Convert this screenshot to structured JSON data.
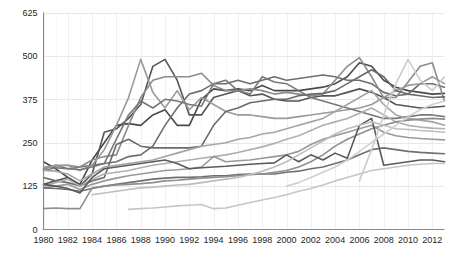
{
  "chart_data": {
    "type": "line",
    "title": "",
    "subtitle": "",
    "xlabel": "",
    "ylabel": "",
    "xlim": [
      1980,
      2013
    ],
    "ylim": [
      0,
      625
    ],
    "ytick_values": [
      0,
      125,
      250,
      375,
      500,
      625
    ],
    "ytick_labels": [
      "0",
      "125",
      "250",
      "375",
      "500",
      "625"
    ],
    "xtick_values": [
      1980,
      1982,
      1984,
      1986,
      1988,
      1990,
      1992,
      1994,
      1996,
      1998,
      2000,
      2002,
      2004,
      2006,
      2008,
      2010,
      2012
    ],
    "xtick_labels": [
      "1980",
      "1982",
      "1984",
      "1986",
      "1988",
      "1990",
      "1992",
      "1994",
      "1996",
      "1998",
      "2000",
      "2002",
      "2004",
      "2006",
      "2008",
      "2010",
      "2012"
    ],
    "grid": {
      "horizontal": true,
      "vertical": true,
      "horizontal_color": "#e8e8e8",
      "vertical_color": "#f0f0f0"
    },
    "legend": {
      "visible": false,
      "position": "none"
    },
    "axis_color": "#8a8a8a",
    "background_color": "#ffffff",
    "x": [
      1980,
      1981,
      1982,
      1983,
      1984,
      1985,
      1986,
      1987,
      1988,
      1989,
      1990,
      1991,
      1992,
      1993,
      1994,
      1995,
      1996,
      1997,
      1998,
      1999,
      2000,
      2001,
      2002,
      2003,
      2004,
      2005,
      2006,
      2007,
      2008,
      2009,
      2010,
      2011,
      2012,
      2013
    ],
    "series": [
      {
        "name": "series-1",
        "color": "#4a4a4a",
        "width": 1.6,
        "values": [
          195,
          175,
          150,
          130,
          200,
          250,
          300,
          305,
          300,
          330,
          345,
          300,
          300,
          375,
          405,
          400,
          405,
          400,
          415,
          400,
          400,
          400,
          405,
          410,
          420,
          440,
          480,
          470,
          430,
          410,
          400,
          395,
          390,
          392
        ]
      },
      {
        "name": "series-2",
        "color": "#555555",
        "width": 1.6,
        "values": [
          130,
          140,
          150,
          125,
          160,
          280,
          290,
          320,
          360,
          470,
          490,
          430,
          330,
          330,
          380,
          390,
          400,
          385,
          390,
          375,
          370,
          370,
          380,
          385,
          385,
          395,
          405,
          395,
          380,
          360,
          355,
          350,
          352,
          355
        ]
      },
      {
        "name": "series-3",
        "color": "#6e6e6e",
        "width": 1.6,
        "values": [
          175,
          185,
          175,
          180,
          185,
          190,
          195,
          210,
          215,
          240,
          300,
          350,
          390,
          400,
          420,
          420,
          430,
          420,
          430,
          440,
          430,
          435,
          440,
          445,
          440,
          430,
          430,
          420,
          395,
          385,
          390,
          420,
          420,
          410
        ]
      },
      {
        "name": "series-4",
        "color": "#8c8c8c",
        "width": 1.6,
        "values": [
          175,
          185,
          185,
          180,
          200,
          210,
          215,
          300,
          380,
          430,
          440,
          440,
          440,
          450,
          415,
          400,
          400,
          405,
          400,
          390,
          395,
          390,
          385,
          390,
          430,
          470,
          495,
          440,
          380,
          380,
          425,
          470,
          480,
          370
        ]
      },
      {
        "name": "series-5",
        "color": "#9a9a9a",
        "width": 1.6,
        "values": [
          180,
          182,
          185,
          170,
          185,
          230,
          300,
          380,
          490,
          395,
          350,
          400,
          345,
          380,
          360,
          340,
          330,
          330,
          325,
          320,
          320,
          325,
          330,
          335,
          340,
          345,
          350,
          360,
          380,
          400,
          415,
          420,
          440,
          420
        ]
      },
      {
        "name": "series-6",
        "color": "#787878",
        "width": 1.6,
        "values": [
          170,
          178,
          175,
          172,
          180,
          190,
          260,
          330,
          370,
          350,
          375,
          370,
          360,
          355,
          420,
          430,
          400,
          390,
          440,
          425,
          420,
          400,
          380,
          370,
          360,
          350,
          340,
          330,
          320,
          320,
          325,
          330,
          330,
          325
        ]
      },
      {
        "name": "series-7",
        "color": "#6a6a6a",
        "width": 1.6,
        "values": [
          150,
          140,
          135,
          125,
          140,
          150,
          245,
          260,
          240,
          235,
          235,
          235,
          235,
          240,
          300,
          340,
          350,
          365,
          370,
          375,
          375,
          385,
          390,
          392,
          400,
          420,
          440,
          460,
          440,
          400,
          390,
          385,
          380,
          382
        ]
      },
      {
        "name": "series-8",
        "color": "#a5a5a5",
        "width": 1.6,
        "values": [
          170,
          168,
          160,
          140,
          160,
          180,
          185,
          190,
          195,
          200,
          210,
          220,
          230,
          240,
          245,
          250,
          260,
          265,
          275,
          280,
          290,
          300,
          310,
          320,
          340,
          360,
          380,
          400,
          360,
          330,
          320,
          315,
          310,
          300
        ]
      },
      {
        "name": "series-9",
        "color": "#b0b0b0",
        "width": 1.6,
        "values": [
          125,
          135,
          145,
          125,
          145,
          160,
          165,
          170,
          178,
          185,
          190,
          195,
          200,
          205,
          210,
          215,
          222,
          230,
          238,
          248,
          260,
          270,
          285,
          300,
          310,
          320,
          335,
          350,
          330,
          310,
          300,
          295,
          292,
          290
        ]
      },
      {
        "name": "series-10",
        "color": "#999999",
        "width": 1.6,
        "values": [
          120,
          125,
          130,
          115,
          130,
          140,
          148,
          155,
          160,
          165,
          170,
          172,
          175,
          180,
          210,
          195,
          198,
          200,
          205,
          210,
          215,
          225,
          245,
          260,
          270,
          280,
          290,
          300,
          280,
          270,
          265,
          262,
          260,
          258
        ]
      },
      {
        "name": "series-11",
        "color": "#707070",
        "width": 1.6,
        "values": [
          120,
          118,
          115,
          110,
          118,
          125,
          130,
          135,
          140,
          145,
          148,
          150,
          150,
          152,
          155,
          155,
          158,
          160,
          160,
          160,
          165,
          168,
          175,
          180,
          190,
          200,
          215,
          230,
          235,
          230,
          225,
          222,
          220,
          218
        ]
      },
      {
        "name": "series-12",
        "color": "#8f8f8f",
        "width": 1.6,
        "values": [
          60,
          62,
          60,
          60,
          120,
          125,
          128,
          130,
          132,
          135,
          140,
          142,
          145,
          148,
          150,
          152,
          155,
          158,
          160,
          165,
          170,
          180,
          195,
          215,
          240,
          260,
          275,
          290,
          300,
          310,
          315,
          318,
          320,
          318
        ]
      },
      {
        "name": "series-13",
        "color": "#5a5a5a",
        "width": 1.6,
        "values": [
          130,
          125,
          118,
          105,
          150,
          175,
          180,
          185,
          190,
          195,
          200,
          190,
          175,
          178,
          180,
          182,
          185,
          188,
          190,
          192,
          215,
          195,
          215,
          200,
          220,
          205,
          300,
          320,
          185,
          190,
          195,
          200,
          200,
          195
        ]
      },
      {
        "name": "series-14",
        "color": "#bdbdbd",
        "width": 1.6,
        "values": [
          null,
          null,
          null,
          null,
          100,
          105,
          110,
          115,
          120,
          122,
          125,
          128,
          130,
          135,
          140,
          145,
          150,
          158,
          168,
          180,
          195,
          215,
          235,
          255,
          275,
          290,
          300,
          310,
          300,
          290,
          288,
          285,
          283,
          280
        ]
      },
      {
        "name": "series-15",
        "color": "#c6c6c6",
        "width": 1.6,
        "values": [
          null,
          null,
          null,
          null,
          null,
          null,
          null,
          58,
          60,
          62,
          65,
          68,
          70,
          72,
          60,
          62,
          70,
          78,
          85,
          92,
          100,
          110,
          118,
          128,
          140,
          150,
          160,
          170,
          175,
          180,
          185,
          188,
          190,
          190
        ]
      },
      {
        "name": "series-16",
        "color": "#d0d0d0",
        "width": 1.6,
        "values": [
          null,
          null,
          null,
          null,
          null,
          null,
          null,
          null,
          null,
          null,
          null,
          null,
          null,
          null,
          null,
          null,
          null,
          null,
          null,
          null,
          125,
          135,
          150,
          165,
          180,
          200,
          225,
          250,
          275,
          300,
          325,
          345,
          360,
          370
        ]
      },
      {
        "name": "series-17",
        "color": "#cccccc",
        "width": 1.6,
        "values": [
          null,
          null,
          null,
          null,
          null,
          null,
          null,
          null,
          null,
          null,
          null,
          null,
          null,
          null,
          null,
          null,
          null,
          null,
          null,
          null,
          null,
          null,
          null,
          null,
          null,
          null,
          140,
          230,
          330,
          420,
          490,
          430,
          400,
          440
        ]
      }
    ]
  }
}
